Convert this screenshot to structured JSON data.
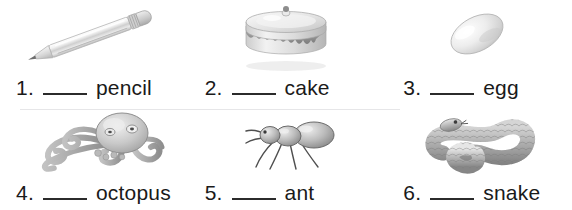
{
  "worksheet": {
    "layout": {
      "columns": 3,
      "rows": 2
    },
    "divider_color": "#e6e6e8",
    "blank_color": "#2b2b2b",
    "text_color": "#1a1a1a",
    "items": [
      {
        "number": "1.",
        "word": "pencil",
        "blank": "",
        "image": "pencil-image"
      },
      {
        "number": "2.",
        "word": "cake",
        "blank": "",
        "image": "cake-image"
      },
      {
        "number": "3.",
        "word": "egg",
        "blank": "",
        "image": "egg-image"
      },
      {
        "number": "4.",
        "word": "octopus",
        "blank": "",
        "image": "octopus-image"
      },
      {
        "number": "5.",
        "word": "ant",
        "blank": "",
        "image": "ant-image"
      },
      {
        "number": "6.",
        "word": "snake",
        "blank": "",
        "image": "snake-image"
      }
    ]
  }
}
